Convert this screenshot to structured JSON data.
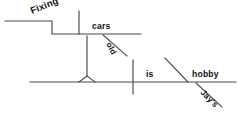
{
  "diagram": {
    "type": "reed-kellogg-sentence-diagram",
    "sentence": "Fixing old cars is Jay's hobby.",
    "ink_color": "#4a4a4a",
    "text_color": "#111111",
    "background": "#ffffff",
    "words": {
      "subject_gerund": "Fixing",
      "gerund_object": "cars",
      "object_modifier": "old",
      "verb": "is",
      "predicate_noun": "hobby",
      "predicate_modifier": "Jay's"
    },
    "labels": [
      {
        "id": "fixing",
        "text": "Fixing",
        "role": "gerund-subject",
        "rotation": -22
      },
      {
        "id": "cars",
        "text": "cars",
        "role": "direct-object-of-gerund",
        "rotation": 0
      },
      {
        "id": "old",
        "text": "old",
        "role": "adjective-modifier",
        "rotation": 62
      },
      {
        "id": "is",
        "text": "is",
        "role": "linking-verb",
        "rotation": 0
      },
      {
        "id": "hobby",
        "text": "hobby",
        "role": "predicate-nominative",
        "rotation": 0
      },
      {
        "id": "jays",
        "text": "Jay's",
        "role": "possessive-modifier",
        "rotation": 45
      }
    ],
    "parts": [
      {
        "id": "baseline",
        "kind": "horizontal-baseline"
      },
      {
        "id": "verb-divider",
        "kind": "vertical-divider"
      },
      {
        "id": "predicate-slant",
        "kind": "slanted-divider"
      },
      {
        "id": "pedestal",
        "kind": "triangle-support"
      },
      {
        "id": "stem",
        "kind": "vertical-stem"
      },
      {
        "id": "gerund-step-line",
        "kind": "stepped-line"
      },
      {
        "id": "gerund-object-divider",
        "kind": "vertical-divider"
      },
      {
        "id": "old-modifier-line",
        "kind": "diagonal-modifier"
      },
      {
        "id": "jays-modifier-line",
        "kind": "diagonal-modifier"
      }
    ]
  }
}
